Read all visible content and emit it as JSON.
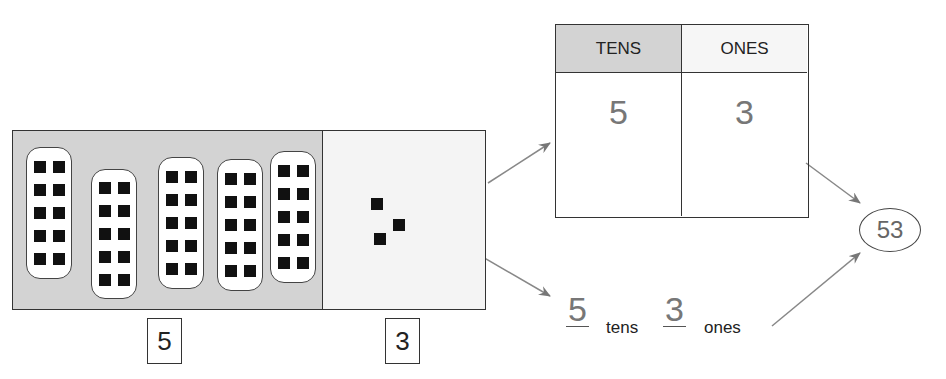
{
  "model": {
    "tens_rods": 5,
    "cubes_per_rod": 10,
    "ones_units": 3,
    "tens_label": "5",
    "ones_label": "3",
    "colors": {
      "tens_bg": "#d3d3d3",
      "ones_bg": "#f4f4f4",
      "cube": "#111111"
    }
  },
  "place_value_chart": {
    "headers": [
      "TENS",
      "ONES"
    ],
    "values": [
      "5",
      "3"
    ],
    "colors": {
      "tens_header_bg": "#d3d3d3",
      "value_text": "#777777"
    }
  },
  "word_form": {
    "tens_value": "5",
    "tens_word": "tens",
    "ones_value": "3",
    "ones_word": "ones"
  },
  "result": {
    "number": "53"
  }
}
